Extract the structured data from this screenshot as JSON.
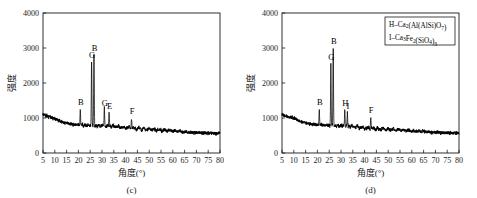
{
  "figure": {
    "panels": [
      {
        "id": "c",
        "sublabel": "(c)",
        "legend": null
      },
      {
        "id": "d",
        "sublabel": "(d)",
        "legend": {
          "items": [
            {
              "prefix": "H-Ca",
              "formula": "H-Ca2(Al(AlSi)O7)"
            },
            {
              "prefix": "I-Ca",
              "formula": "I-Ca3Fe2(SiO4)3"
            }
          ]
        }
      }
    ]
  },
  "chart_data": [
    {
      "type": "line",
      "panel": "c",
      "title": "(c)",
      "xlabel": "角度(°)",
      "ylabel": "强度",
      "xlim": [
        5,
        80
      ],
      "ylim": [
        0,
        4000
      ],
      "xticks": [
        5,
        10,
        15,
        20,
        25,
        30,
        35,
        40,
        45,
        50,
        55,
        60,
        65,
        70,
        75,
        80
      ],
      "yticks": [
        0,
        1000,
        2000,
        3000,
        4000
      ],
      "grid": false,
      "legend_position": "none",
      "baseline": {
        "x": [
          5,
          8,
          11,
          13,
          16,
          20,
          25,
          30,
          35,
          40,
          45,
          50,
          55,
          60,
          65,
          70,
          75,
          80
        ],
        "y": [
          1090,
          1020,
          950,
          880,
          830,
          800,
          780,
          770,
          760,
          720,
          690,
          670,
          650,
          630,
          600,
          580,
          565,
          555
        ]
      },
      "noise_amplitude": 42,
      "annotations": [
        {
          "label": "B",
          "x": 20.8,
          "y": 1330
        },
        {
          "label": "G",
          "x": 25.6,
          "y": 2680
        },
        {
          "label": "B",
          "x": 26.6,
          "y": 2880
        },
        {
          "label": "G",
          "x": 31.0,
          "y": 1310
        },
        {
          "label": "E",
          "x": 33.0,
          "y": 1220
        },
        {
          "label": "F",
          "x": 42.5,
          "y": 1060
        }
      ],
      "peaks": [
        {
          "label": "B",
          "x": 20.8,
          "height": 1290
        },
        {
          "label": "G",
          "x": 25.6,
          "height": 2640
        },
        {
          "label": "B",
          "x": 26.6,
          "height": 2840
        },
        {
          "label": "G",
          "x": 31.0,
          "height": 1270
        },
        {
          "label": "E",
          "x": 33.0,
          "height": 1180
        },
        {
          "label": "F",
          "x": 42.5,
          "height": 1000
        }
      ]
    },
    {
      "type": "line",
      "panel": "d",
      "title": "(d)",
      "xlabel": "角度(°)",
      "ylabel": "强度",
      "xlim": [
        5,
        80
      ],
      "ylim": [
        0,
        4000
      ],
      "xticks": [
        5,
        10,
        15,
        20,
        25,
        30,
        35,
        40,
        45,
        50,
        55,
        60,
        65,
        70,
        75,
        80
      ],
      "yticks": [
        0,
        1000,
        2000,
        3000,
        4000
      ],
      "grid": false,
      "legend_position": "top-right",
      "baseline": {
        "x": [
          5,
          8,
          11,
          13,
          16,
          20,
          25,
          30,
          35,
          40,
          45,
          50,
          55,
          60,
          65,
          70,
          75,
          80
        ],
        "y": [
          1090,
          1030,
          960,
          890,
          840,
          800,
          785,
          775,
          750,
          710,
          690,
          670,
          650,
          630,
          610,
          585,
          570,
          560
        ]
      },
      "noise_amplitude": 42,
      "annotations": [
        {
          "label": "B",
          "x": 20.8,
          "y": 1320
        },
        {
          "label": "G",
          "x": 25.7,
          "y": 2610
        },
        {
          "label": "B",
          "x": 26.7,
          "y": 3060
        },
        {
          "label": "H",
          "x": 31.6,
          "y": 1290
        },
        {
          "label": "I",
          "x": 32.7,
          "y": 1210
        },
        {
          "label": "F",
          "x": 42.6,
          "y": 1090
        }
      ],
      "peaks": [
        {
          "label": "B",
          "x": 20.8,
          "height": 1270
        },
        {
          "label": "G",
          "x": 25.7,
          "height": 2580
        },
        {
          "label": "B",
          "x": 26.7,
          "height": 3020
        },
        {
          "label": "H",
          "x": 31.6,
          "height": 1230
        },
        {
          "label": "I",
          "x": 32.7,
          "height": 1150
        },
        {
          "label": "F",
          "x": 42.6,
          "height": 1030
        }
      ]
    }
  ]
}
